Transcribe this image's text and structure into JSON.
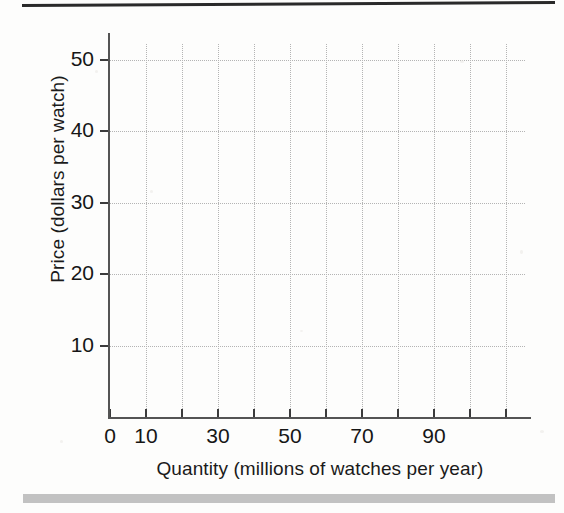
{
  "figure": {
    "background_color": "#fdfdfc",
    "ink_color": "#1c1c1c",
    "top_rule_color": "#2a2a2a",
    "bottom_bar_color": "#b9b9b9",
    "grid_color": "#b4b4b4",
    "axis_color": "#545454"
  },
  "chart_data": {
    "type": "line",
    "title": "",
    "subtitle": "",
    "xlabel": "Quantity (millions of watches per year)",
    "ylabel": "Price (dollars per watch)",
    "xlim": [
      0,
      110
    ],
    "ylim": [
      0,
      55
    ],
    "grid": true,
    "legend": null,
    "legend_position": "none",
    "series": [],
    "annotations": [],
    "x_ticks": [
      {
        "value": 0,
        "label": "0",
        "labeled": true
      },
      {
        "value": 10,
        "label": "10",
        "labeled": true
      },
      {
        "value": 20,
        "label": "",
        "labeled": false
      },
      {
        "value": 30,
        "label": "30",
        "labeled": true
      },
      {
        "value": 40,
        "label": "",
        "labeled": false
      },
      {
        "value": 50,
        "label": "50",
        "labeled": true
      },
      {
        "value": 60,
        "label": "",
        "labeled": false
      },
      {
        "value": 70,
        "label": "70",
        "labeled": true
      },
      {
        "value": 80,
        "label": "",
        "labeled": false
      },
      {
        "value": 90,
        "label": "90",
        "labeled": true
      },
      {
        "value": 100,
        "label": "",
        "labeled": false
      },
      {
        "value": 110,
        "label": "",
        "labeled": false
      }
    ],
    "y_ticks": [
      {
        "value": 10,
        "label": "10",
        "labeled": true
      },
      {
        "value": 20,
        "label": "20",
        "labeled": true
      },
      {
        "value": 30,
        "label": "30",
        "labeled": true
      },
      {
        "value": 40,
        "label": "40",
        "labeled": true
      },
      {
        "value": 50,
        "label": "50",
        "labeled": true
      }
    ],
    "x_tick_labels": [
      "0",
      "10",
      "30",
      "50",
      "70",
      "90"
    ],
    "y_tick_labels": [
      "10",
      "20",
      "30",
      "40",
      "50"
    ],
    "values": [],
    "categories": [],
    "note": "Blank worksheet grid; no data series are plotted."
  }
}
